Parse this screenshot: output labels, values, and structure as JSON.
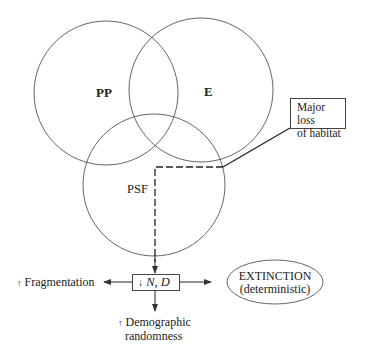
{
  "diagram": {
    "circles": [
      {
        "id": "pp",
        "label": "PP",
        "cx": 106,
        "cy": 93,
        "r": 72
      },
      {
        "id": "e",
        "label": "E",
        "cx": 201,
        "cy": 90,
        "r": 72
      },
      {
        "id": "psf",
        "label": "PSF",
        "cx": 154,
        "cy": 185,
        "r": 71
      }
    ],
    "habitat_box": {
      "line1": "Major loss",
      "line2": "of habitat"
    },
    "center_box": {
      "arrow": "↓",
      "label": "N, D"
    },
    "fragmentation": {
      "arrow": "↑",
      "label": "Fragmentation"
    },
    "demographic": {
      "arrow": "↑",
      "line1": "Demographic",
      "line2": "randomness"
    },
    "extinction": {
      "line1": "EXTINCTION",
      "line2": "(deterministic)"
    },
    "colors": {
      "line": "#444444",
      "background": "#ffffff"
    }
  }
}
